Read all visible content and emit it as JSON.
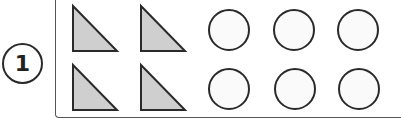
{
  "problem": {
    "number": "1",
    "triangles": {
      "count": 4,
      "fill": "#cfcfcf",
      "stroke": "#2a2a2a",
      "items": [
        {
          "x": 73,
          "y": 6
        },
        {
          "x": 141,
          "y": 6
        },
        {
          "x": 73,
          "y": 65
        },
        {
          "x": 141,
          "y": 65
        }
      ],
      "width": 44,
      "height": 45
    },
    "circles": {
      "count": 6,
      "fill": "#fafafa",
      "stroke": "#2a2a2a",
      "radius": 20,
      "items": [
        {
          "cx": 229,
          "cy": 30
        },
        {
          "cx": 294,
          "cy": 30
        },
        {
          "cx": 358,
          "cy": 30
        },
        {
          "cx": 229,
          "cy": 89
        },
        {
          "cx": 295,
          "cy": 89
        },
        {
          "cx": 359,
          "cy": 89
        }
      ]
    }
  }
}
